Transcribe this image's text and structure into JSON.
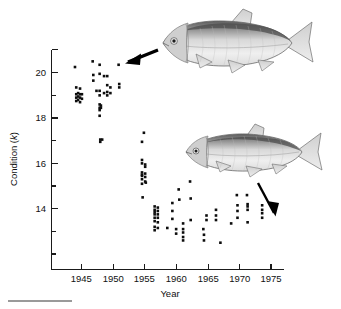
{
  "figure": {
    "name": "fish-condition-scatterplot",
    "background_color": "#ffffff",
    "ink_color": "#111111"
  },
  "axes": {
    "x_title": "Year",
    "y_title_prefix": "Condition (",
    "y_title_italic": "k",
    "y_title_suffix": ")",
    "x_ticks": [
      "1945",
      "1950",
      "1955",
      "1960",
      "1965",
      "1970",
      "1975"
    ],
    "y_ticks": [
      "14",
      "16",
      "18",
      "20"
    ]
  },
  "annotations": {
    "top_fish_label": "large-bodied-fish-illustration",
    "bottom_fish_label": "slender-fish-illustration",
    "top_arrow_label": "arrow-pointing-to-early-cluster",
    "bottom_arrow_label": "arrow-pointing-to-late-cluster"
  },
  "chart_data": {
    "type": "scatter",
    "title": "",
    "xlabel": "Year",
    "ylabel": "Condition (k)",
    "xlim": [
      1942.5,
      1976.5
    ],
    "ylim": [
      12.3,
      21.1
    ],
    "grid": false,
    "legend": null,
    "x_major_ticks": [
      1945,
      1950,
      1955,
      1960,
      1965,
      1970,
      1975
    ],
    "x_minor_ticks": [],
    "y_major_ticks": [
      14,
      16,
      18,
      20
    ],
    "y_minor_ticks": [
      13,
      15,
      17,
      19,
      21
    ],
    "marker": "filled-square",
    "marker_color": "#0d0d0d",
    "marker_size_px": 2.6,
    "series": [
      {
        "name": "Condition factor of individual fish",
        "points": [
          [
            1944.0,
            20.25
          ],
          [
            1944.2,
            19.35
          ],
          [
            1944.2,
            19.05
          ],
          [
            1944.2,
            18.9
          ],
          [
            1944.2,
            18.75
          ],
          [
            1944.5,
            19.1
          ],
          [
            1944.5,
            18.95
          ],
          [
            1944.5,
            18.8
          ],
          [
            1944.8,
            19.3
          ],
          [
            1944.8,
            19.05
          ],
          [
            1944.8,
            18.9
          ],
          [
            1944.8,
            18.7
          ],
          [
            1945.1,
            19.05
          ],
          [
            1945.1,
            18.85
          ],
          [
            1946.8,
            20.5
          ],
          [
            1946.9,
            19.9
          ],
          [
            1946.9,
            19.65
          ],
          [
            1947.4,
            19.2
          ],
          [
            1947.9,
            20.35
          ],
          [
            1947.9,
            19.95
          ],
          [
            1947.9,
            19.2
          ],
          [
            1947.9,
            19.0
          ],
          [
            1947.9,
            18.6
          ],
          [
            1947.9,
            18.45
          ],
          [
            1947.9,
            18.35
          ],
          [
            1947.9,
            18.1
          ],
          [
            1948.1,
            18.55
          ],
          [
            1948.1,
            18.45
          ],
          [
            1948.6,
            19.85
          ],
          [
            1948.6,
            19.1
          ],
          [
            1949.1,
            19.85
          ],
          [
            1949.1,
            19.45
          ],
          [
            1949.1,
            19.15
          ],
          [
            1949.1,
            19.0
          ],
          [
            1949.6,
            19.35
          ],
          [
            1949.6,
            19.1
          ],
          [
            1950.9,
            20.35
          ],
          [
            1951.0,
            19.5
          ],
          [
            1951.0,
            19.35
          ],
          [
            1948.0,
            17.05
          ],
          [
            1948.0,
            16.95
          ],
          [
            1948.3,
            17.05
          ],
          [
            1954.9,
            17.35
          ],
          [
            1954.6,
            16.95
          ],
          [
            1954.6,
            16.15
          ],
          [
            1954.6,
            16.0
          ],
          [
            1954.6,
            15.6
          ],
          [
            1954.6,
            15.5
          ],
          [
            1954.6,
            15.45
          ],
          [
            1954.6,
            15.3
          ],
          [
            1954.6,
            15.1
          ],
          [
            1955.1,
            15.95
          ],
          [
            1955.1,
            15.85
          ],
          [
            1955.1,
            15.55
          ],
          [
            1955.1,
            15.4
          ],
          [
            1955.1,
            15.2
          ],
          [
            1954.7,
            14.5
          ],
          [
            1955.2,
            15.15
          ],
          [
            1956.6,
            14.1
          ],
          [
            1956.6,
            13.95
          ],
          [
            1956.6,
            13.85
          ],
          [
            1956.6,
            13.75
          ],
          [
            1956.6,
            13.6
          ],
          [
            1956.6,
            13.45
          ],
          [
            1956.6,
            13.2
          ],
          [
            1956.6,
            13.05
          ],
          [
            1957.1,
            14.05
          ],
          [
            1957.1,
            13.9
          ],
          [
            1957.1,
            13.75
          ],
          [
            1957.1,
            13.6
          ],
          [
            1957.1,
            13.4
          ],
          [
            1957.1,
            13.15
          ],
          [
            1958.6,
            13.15
          ],
          [
            1959.4,
            14.25
          ],
          [
            1959.4,
            13.9
          ],
          [
            1959.4,
            13.55
          ],
          [
            1960.0,
            13.1
          ],
          [
            1960.0,
            12.9
          ],
          [
            1960.4,
            14.85
          ],
          [
            1960.5,
            14.4
          ],
          [
            1961.1,
            13.35
          ],
          [
            1961.1,
            13.1
          ],
          [
            1961.1,
            12.95
          ],
          [
            1961.1,
            12.75
          ],
          [
            1961.1,
            12.6
          ],
          [
            1962.2,
            15.2
          ],
          [
            1962.3,
            14.45
          ],
          [
            1962.3,
            13.5
          ],
          [
            1964.3,
            13.1
          ],
          [
            1964.4,
            12.85
          ],
          [
            1964.4,
            12.6
          ],
          [
            1964.8,
            13.7
          ],
          [
            1964.8,
            13.5
          ],
          [
            1966.3,
            13.95
          ],
          [
            1966.3,
            13.7
          ],
          [
            1966.3,
            13.5
          ],
          [
            1967.0,
            12.5
          ],
          [
            1968.7,
            13.35
          ],
          [
            1969.6,
            14.6
          ],
          [
            1969.7,
            14.15
          ],
          [
            1969.7,
            13.9
          ],
          [
            1969.7,
            13.6
          ],
          [
            1971.2,
            14.6
          ],
          [
            1971.3,
            14.2
          ],
          [
            1971.3,
            14.1
          ],
          [
            1971.3,
            13.95
          ],
          [
            1971.3,
            13.4
          ],
          [
            1973.6,
            14.15
          ],
          [
            1973.6,
            13.95
          ],
          [
            1973.6,
            13.8
          ],
          [
            1973.6,
            13.6
          ]
        ]
      }
    ]
  }
}
